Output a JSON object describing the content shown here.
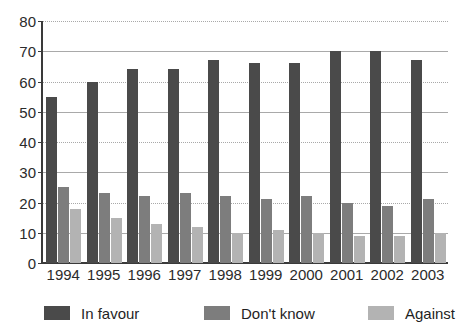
{
  "chart_data": {
    "type": "bar",
    "title": "",
    "subtitle": "",
    "xlabel": "",
    "ylabel": "",
    "categories": [
      "1994",
      "1995",
      "1996",
      "1997",
      "1998",
      "1999",
      "2000",
      "2001",
      "2002",
      "2003"
    ],
    "series": [
      {
        "name": "In favour",
        "color": "#4a4a4a",
        "values": [
          55,
          60,
          64,
          64,
          67,
          66,
          66,
          70,
          70,
          67
        ]
      },
      {
        "name": "Don't know",
        "color": "#7d7d7d",
        "values": [
          25,
          23,
          22,
          23,
          22,
          21,
          22,
          20,
          19,
          21
        ]
      },
      {
        "name": "Against",
        "color": "#b3b3b3",
        "values": [
          18,
          15,
          13,
          12,
          10,
          11,
          10,
          9,
          9,
          10
        ]
      }
    ],
    "ylim": [
      0,
      80
    ],
    "ytick_labels": [
      "0",
      "10",
      "20",
      "30",
      "40",
      "50",
      "60",
      "70",
      "80"
    ],
    "ytick_values": [
      0,
      10,
      20,
      30,
      40,
      50,
      60,
      70,
      80
    ],
    "grid": true,
    "grid_axis": "y",
    "legend_position": "bottom",
    "legend": [
      "In favour",
      "Don't know",
      "Against"
    ]
  },
  "colors": {
    "series_in_favour": "#4a4a4a",
    "series_dont_know": "#7d7d7d",
    "series_against": "#b3b3b3",
    "axis": "#3a3a3a",
    "gridline": "#a9a9a9",
    "text": "#2b2b2b",
    "background": "#ffffff"
  }
}
